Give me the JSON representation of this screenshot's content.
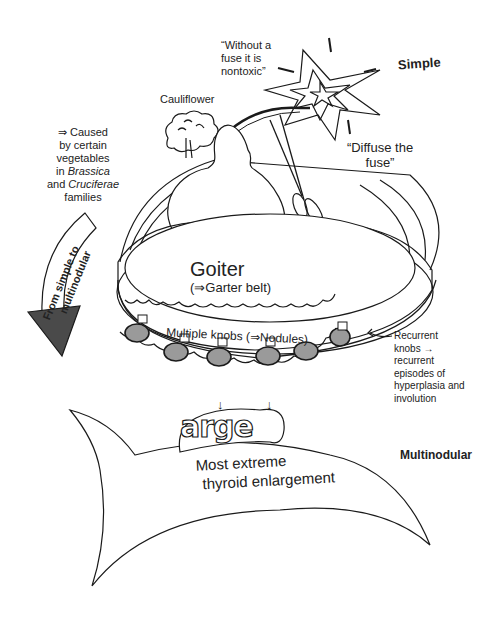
{
  "labels": {
    "simple": "Simple",
    "multinodular": "Multinodular",
    "cauliflower": "Cauliflower",
    "quote_nontoxic": [
      "“Without a",
      "fuse it is",
      "nontoxic”"
    ],
    "quote_diffuse": [
      "“Diffuse the",
      "fuse”"
    ],
    "caused_by": {
      "line1": "⇒ Caused",
      "line2": "by certain",
      "line3": "vegetables",
      "line4_prefix": "in ",
      "line4_italic": "Brassica",
      "line5_prefix": "and ",
      "line5_italic": "Cruciferae",
      "line6": "families"
    },
    "arrow_text": [
      "From simple to",
      "multinodular"
    ],
    "goiter": "Goiter",
    "garter": "(⇒Garter belt)",
    "knobs": "Multiple knobs (⇒Nodules)",
    "recurrent": [
      "Recurrent",
      "knobs →",
      "recurrent",
      "episodes of",
      "hyperplasia and",
      "involution"
    ],
    "large_bubble": "arge",
    "extreme": [
      "Most extreme",
      "thyroid enlargement"
    ],
    "down_arrow": "↓"
  },
  "colors": {
    "ink": "#1a1a1a",
    "nodule_fill": "#9a9a9a",
    "arrow_head": "#4a4a4a"
  }
}
